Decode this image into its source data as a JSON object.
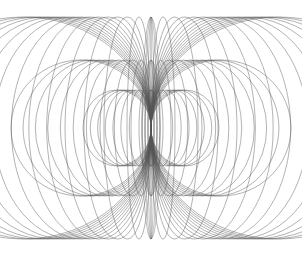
{
  "figure": {
    "background": "#ffffff",
    "stroke_color": "#555555",
    "center": [
      151,
      128
    ],
    "families": [
      {
        "name": "outer",
        "cy": 128,
        "top": 17,
        "bottom": 239,
        "count": 14,
        "rx_min": 12,
        "rx_max": 128
      },
      {
        "name": "middle",
        "cy": 128,
        "top": 60,
        "bottom": 196,
        "count": 10,
        "rx_min": 10,
        "rx_max": 70
      },
      {
        "name": "inner",
        "cy": 128,
        "top": 90,
        "bottom": 166,
        "count": 8,
        "rx_min": 6,
        "rx_max": 34
      }
    ]
  }
}
